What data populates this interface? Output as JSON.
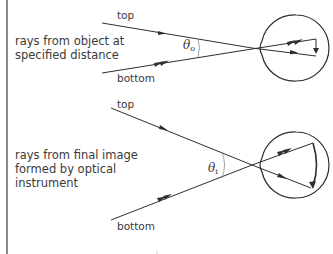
{
  "diagram": {
    "panels": [
      {
        "id": "object",
        "caption_lines": [
          "rays from object at",
          "specified distance"
        ],
        "ray_labels": {
          "top": "top",
          "bottom": "bottom"
        },
        "angle_symbol": "θ",
        "angle_subscript": "o",
        "angle_name": "theta_o"
      },
      {
        "id": "image",
        "caption_lines": [
          "rays from final image",
          "formed by optical",
          "instrument"
        ],
        "ray_labels": {
          "top": "top",
          "bottom": "bottom"
        },
        "angle_symbol": "θ",
        "angle_subscript": "i",
        "angle_name": "theta_i"
      }
    ],
    "colors": {
      "line": "#2e2e2e",
      "text": "#3a3a3a",
      "angle_arc": "#8a8a8a",
      "border": "#8a8a8a",
      "background": "#ffffff"
    }
  }
}
